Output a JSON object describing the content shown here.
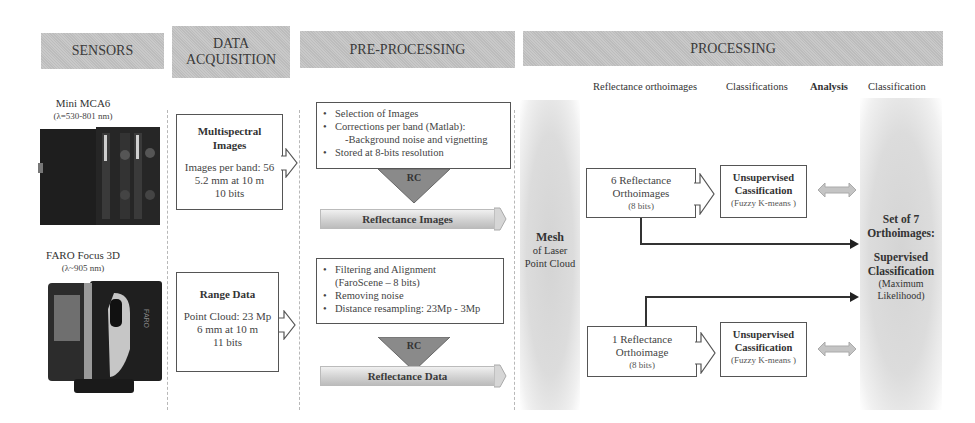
{
  "headers": {
    "sensors": "SENSORS",
    "data_acquisition_line1": "DATA",
    "data_acquisition_line2": "ACQUISITION",
    "pre_processing": "PRE-PROCESSING",
    "processing": "PROCESSING"
  },
  "processing_columns": {
    "reflectance_orthoimages": "Reflectance orthoimages",
    "classifications": "Classifications",
    "analysis": "Analysis",
    "classification": "Classification"
  },
  "sensors": [
    {
      "name": "Mini MCA6",
      "wavelength": "(λ=530-801 nm)",
      "icon": "multispectral-camera-photo"
    },
    {
      "name": "FARO Focus 3D",
      "wavelength": "(λ~905 nm)",
      "icon": "laser-scanner-photo",
      "brand_mark": "FARO"
    }
  ],
  "acquisition": [
    {
      "title_line1": "Multispectral",
      "title_line2": "Images",
      "lines": [
        "Images per band: 56",
        "5.2 mm at 10 m",
        "10 bits"
      ]
    },
    {
      "title_line1": "Range Data",
      "lines": [
        "Point Cloud: 23 Mp",
        "6 mm at 10 m",
        "11 bits"
      ]
    }
  ],
  "preprocessing": [
    {
      "steps": [
        "Selection of Images",
        "Corrections per band (Matlab):"
      ],
      "sub_step": "-Background noise and vignetting",
      "last_step": "Stored at 8-bits resolution",
      "rc_label": "RC",
      "result": "Reflectance Images"
    },
    {
      "steps": [
        "Filtering and Alignment"
      ],
      "sub_step": "(FaroScene – 8 bits)",
      "more_steps": [
        "Removing noise",
        "Distance resampling: 23Mp - 3Mp"
      ],
      "rc_label": "RC",
      "result": "Reflectance Data"
    }
  ],
  "mesh": {
    "title": "Mesh",
    "line1": "of Laser",
    "line2": "Point Cloud"
  },
  "orthoimages": [
    {
      "line1": "6 Reflectance",
      "line2": "Orthoimages",
      "bits": "(8 bits)"
    },
    {
      "line1": "1 Reflectance",
      "line2": "Orthoimage",
      "bits": "(8 bits)"
    }
  ],
  "unsupervised": [
    {
      "line1": "Unsupervised",
      "line2": "Cassification",
      "method": "(Fuzzy K-means )"
    },
    {
      "line1": "Unsupervised",
      "line2": "Cassification",
      "method": "(Fuzzy K-means )"
    }
  ],
  "final": {
    "line1": "Set of 7",
    "line2": "Orthoimages:",
    "line3": "Supervised",
    "line4": "Classification",
    "line5": "(Maximum",
    "line6": "Likelihood)"
  },
  "colors": {
    "header_bg": "#c4c4c4",
    "box_border": "#555555",
    "gray_column": "#d8d8d8",
    "arrow_fill": "#8a8a8a"
  }
}
